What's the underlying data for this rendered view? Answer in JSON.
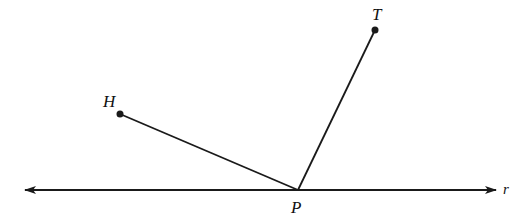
{
  "diagram": {
    "line": {
      "name": "r",
      "label": "r",
      "y": 190,
      "x1": 25,
      "x2": 496
    },
    "points": [
      {
        "id": "H",
        "label": "H",
        "x": 120,
        "y": 114,
        "lx": 103,
        "ly": 107
      },
      {
        "id": "T",
        "label": "T",
        "x": 375,
        "y": 30,
        "lx": 372,
        "ly": 20
      },
      {
        "id": "P",
        "label": "P",
        "x": 298,
        "y": 190,
        "lx": 291,
        "ly": 213
      }
    ],
    "segments": [
      {
        "from": "H",
        "to": "P"
      },
      {
        "from": "T",
        "to": "P"
      }
    ],
    "stroke_color": "#1a1a1a"
  }
}
